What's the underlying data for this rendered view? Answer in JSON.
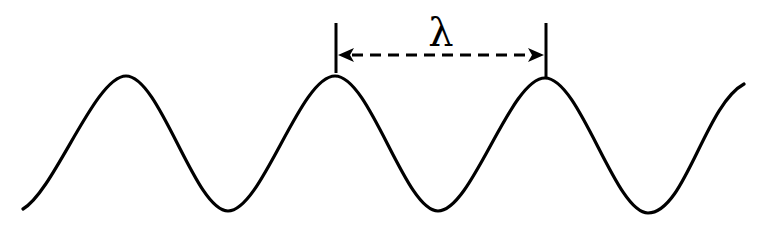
{
  "diagram": {
    "label": "λ",
    "label_meaning": "wavelength",
    "stroke_color": "#000000",
    "background": "#ffffff",
    "wave": {
      "peaks_x": [
        126,
        335,
        545
      ],
      "troughs_x": [
        228,
        438,
        648
      ],
      "peak_y": 76,
      "trough_y": 211,
      "start": [
        23,
        209
      ],
      "end": [
        744,
        84
      ]
    },
    "annotation": {
      "left_tick_x": 336,
      "right_tick_x": 546,
      "arrow_y": 54,
      "style": "dashed double-headed arrow"
    }
  }
}
